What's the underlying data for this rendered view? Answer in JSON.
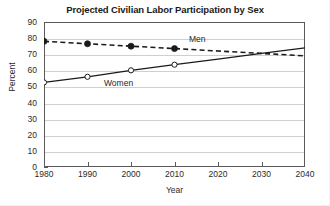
{
  "chart_data": {
    "type": "line",
    "title": "Projected Civilian Labor Participation by Sex",
    "xlabel": "Year",
    "ylabel": "Percent",
    "x": [
      1980,
      1990,
      2000,
      2010,
      2020,
      2030,
      2040
    ],
    "xlim": [
      1980,
      2040
    ],
    "ylim": [
      0,
      90
    ],
    "xticks": [
      "1980",
      "1990",
      "2000",
      "2010",
      "2020",
      "2030",
      "2040"
    ],
    "yticks": [
      "0",
      "10",
      "20",
      "30",
      "40",
      "50",
      "60",
      "70",
      "80",
      "90"
    ],
    "grid": "horizontal",
    "legend": "inline-labels",
    "series": [
      {
        "name": "Men",
        "line_style": "dashed",
        "marker": "filled-circle",
        "color": "#1a1a1a",
        "x": [
          1980,
          1990,
          2000,
          2010,
          2020,
          2030,
          2040
        ],
        "values": [
          78,
          76.5,
          75,
          73.5,
          72,
          70.5,
          69
        ],
        "marked_points": [
          1980,
          1990,
          2000,
          2010
        ]
      },
      {
        "name": "Women",
        "line_style": "solid",
        "marker": "open-circle",
        "color": "#1a1a1a",
        "x": [
          1980,
          1990,
          2000,
          2010,
          2020,
          2030,
          2040
        ],
        "values": [
          52.5,
          56,
          60,
          63.5,
          67,
          70.5,
          74
        ],
        "marked_points": [
          1980,
          1990,
          2000,
          2010
        ]
      }
    ],
    "annotations": [
      {
        "text": "Men",
        "x": 2023,
        "y": 78
      },
      {
        "text": "Women",
        "x": 2003,
        "y": 57
      }
    ]
  },
  "colors": {
    "background": "#ffffff",
    "axis": "#5a5a5a",
    "gridline": "#cfcfcf",
    "text": "#2b2b2b",
    "series": "#1a1a1a"
  }
}
